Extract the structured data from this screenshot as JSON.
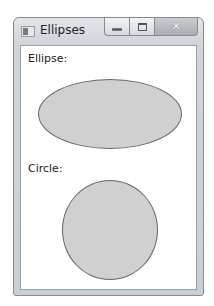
{
  "window": {
    "title": "Ellipses",
    "controls": {
      "minimize": "minimize",
      "maximize": "maximize",
      "close": "close"
    }
  },
  "content": {
    "ellipse_label": "Ellipse:",
    "circle_label": "Circle:"
  },
  "colors": {
    "shape_fill": "#d0d0d0",
    "shape_stroke": "#666666"
  }
}
